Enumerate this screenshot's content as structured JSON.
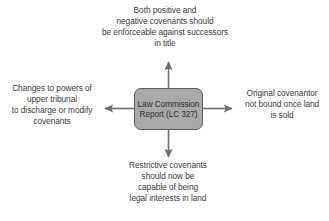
{
  "diagram": {
    "type": "radial-concept-map",
    "background_color": "#ffffff",
    "center": {
      "label_lines": [
        "Law Commission",
        "Report (LC 327)"
      ],
      "fill_color": "#a9a9a9",
      "border_color": "#5d5d5d",
      "text_color": "#2e2e2e"
    },
    "arrow_color": "#6e6e6e",
    "branches": [
      {
        "direction": "up",
        "lines": [
          "Both positive and",
          "negative covenants should",
          "be enforceable against successors",
          "in title"
        ]
      },
      {
        "direction": "left",
        "lines": [
          "Changes to powers of",
          "upper tribunal",
          "to discharge or modify",
          "covenants"
        ]
      },
      {
        "direction": "right",
        "lines": [
          "Original covenantor",
          "not bound once land",
          "is sold"
        ]
      },
      {
        "direction": "down",
        "lines": [
          "Restrictive covenants",
          "should now be",
          "capable of being",
          "legal interests in land"
        ]
      }
    ]
  }
}
